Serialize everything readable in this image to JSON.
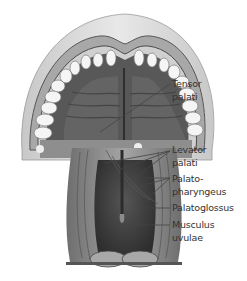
{
  "figure": {
    "labels": [
      {
        "id": "tensor",
        "line1": "Tensor",
        "line2": "palati"
      },
      {
        "id": "levator",
        "line1": "Levator",
        "line2": "palati"
      },
      {
        "id": "palatopharyngeus",
        "line1": "Palato-",
        "line2": "pharyngeus"
      },
      {
        "id": "palatoglossus",
        "line1": "Palatoglossus",
        "line2": ""
      },
      {
        "id": "uvulae",
        "line1": "Musculus",
        "line2": "uvulae"
      }
    ]
  },
  "colors": {
    "label_text": "#333333",
    "leader_line": "#444444",
    "lip_outer": "#d8d8d8",
    "lip_mid": "#b0b0b0",
    "palate_dark": "#4a4a4a",
    "teeth": "#f4f4f4",
    "muscle": "#8a8a8a",
    "pharynx_dark": "#3a3a3a"
  }
}
